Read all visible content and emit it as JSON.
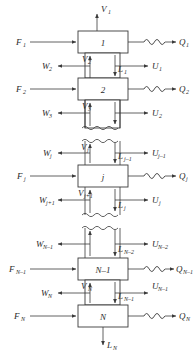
{
  "figure": {
    "kind": "multistage-countercurrent-cascade",
    "stage_count_symbol": "N"
  },
  "colors": {
    "line": "#3a3a3a",
    "text": "#2a2a2a",
    "background": "#ffffff",
    "box_fill": "#ffffff"
  },
  "stages": [
    {
      "id": "stage-1",
      "label": "1",
      "label_sub": "",
      "feed": {
        "base": "F",
        "sub": "1"
      },
      "duty": {
        "base": "Q",
        "sub": "1"
      },
      "has_coil": true
    },
    {
      "id": "stage-2",
      "label": "2",
      "label_sub": "",
      "feed": {
        "base": "F",
        "sub": "2"
      },
      "duty": {
        "base": "Q",
        "sub": "2"
      },
      "has_coil": true
    },
    {
      "id": "stage-j",
      "label": "j",
      "label_sub": "",
      "feed": {
        "base": "F",
        "sub": "j"
      },
      "duty": {
        "base": "Q",
        "sub": "j"
      },
      "has_coil": true
    },
    {
      "id": "stage-n-minus-1",
      "label": "N–1",
      "label_sub": "",
      "feed": {
        "base": "F",
        "sub": "N–1"
      },
      "duty": {
        "base": "Q",
        "sub": "N–1"
      },
      "has_coil": true
    },
    {
      "id": "stage-n",
      "label": "N",
      "label_sub": "",
      "feed": {
        "base": "F",
        "sub": "N"
      },
      "duty": {
        "base": "Q",
        "sub": "N"
      },
      "has_coil": true
    }
  ],
  "streams": {
    "top_vapor": {
      "base": "V",
      "sub": "1",
      "direction": "up",
      "name": "overhead-vapor"
    },
    "bottom_liquid": {
      "base": "L",
      "sub": "N",
      "direction": "down",
      "name": "bottoms-liquid"
    },
    "vapor_interstage": [
      {
        "base": "V",
        "sub": "2"
      },
      {
        "base": "V",
        "sub": "3"
      },
      {
        "base": "V",
        "sub": "j"
      },
      {
        "base": "V",
        "sub": "j+1"
      },
      {
        "base": "V",
        "sub": "N"
      }
    ],
    "liquid_interstage": [
      {
        "base": "L",
        "sub": "1"
      },
      {
        "base": "L",
        "sub": "2"
      },
      {
        "base": "L",
        "sub": "j–1"
      },
      {
        "base": "L",
        "sub": "j"
      },
      {
        "base": "L",
        "sub": "N–2"
      },
      {
        "base": "L",
        "sub": "N–1"
      }
    ],
    "vapor_sidestream": [
      {
        "base": "W",
        "sub": "2"
      },
      {
        "base": "W",
        "sub": "3"
      },
      {
        "base": "W",
        "sub": "j"
      },
      {
        "base": "W",
        "sub": "j+1"
      },
      {
        "base": "W",
        "sub": "N–1"
      },
      {
        "base": "W",
        "sub": "N"
      }
    ],
    "liquid_sidestream": [
      {
        "base": "U",
        "sub": "1"
      },
      {
        "base": "U",
        "sub": "2"
      },
      {
        "base": "U",
        "sub": "j–1"
      },
      {
        "base": "U",
        "sub": "j"
      },
      {
        "base": "U",
        "sub": "N–2"
      },
      {
        "base": "U",
        "sub": "N–1"
      }
    ]
  },
  "break_lines": {
    "count": 4,
    "note": "wavy break lines indicating omitted intermediate stages"
  }
}
